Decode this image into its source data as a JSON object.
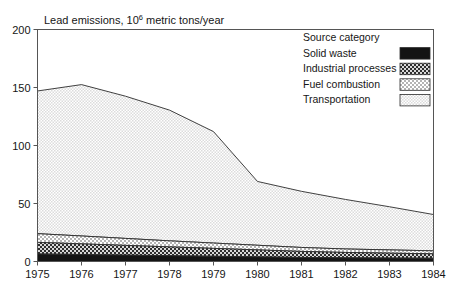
{
  "chart_data": {
    "type": "area",
    "stacked": true,
    "title_main": "Lead emissions, 10",
    "title_exponent": "6",
    "title_tail": " metric tons/year",
    "xlabel": "",
    "ylabel": "",
    "x": [
      1975,
      1976,
      1977,
      1978,
      1979,
      1980,
      1981,
      1982,
      1983,
      1984
    ],
    "categories": [
      "1975",
      "1976",
      "1977",
      "1978",
      "1979",
      "1980",
      "1981",
      "1982",
      "1983",
      "1984"
    ],
    "xlim": [
      1975,
      1984
    ],
    "ylim": [
      0,
      200
    ],
    "yticks": [
      0,
      50,
      100,
      150,
      200
    ],
    "ytick_labels": [
      "0",
      "50",
      "100",
      "150",
      "200"
    ],
    "xticks": [
      1975,
      1976,
      1977,
      1978,
      1979,
      1980,
      1981,
      1982,
      1983,
      1984
    ],
    "grid": false,
    "legend_title": "Source category",
    "legend_position": "top-right",
    "stack_order_bottom_to_top": [
      "Solid waste",
      "Industrial processes",
      "Fuel combustion",
      "Transportation"
    ],
    "series": [
      {
        "name": "Solid waste",
        "fill": "#1c1c1c",
        "pattern": "solid-black",
        "values": [
          6.5,
          6.0,
          5.5,
          5.0,
          4.5,
          4.0,
          3.5,
          3.2,
          3.0,
          2.8
        ]
      },
      {
        "name": "Industrial processes",
        "fill": "#4a4a4a",
        "pattern": "dark-checker",
        "values": [
          10.0,
          9.2,
          8.4,
          7.6,
          6.8,
          6.0,
          5.2,
          4.6,
          4.2,
          3.8
        ]
      },
      {
        "name": "Fuel combustion",
        "fill": "#c9c9c9",
        "pattern": "light-checker",
        "values": [
          7.5,
          6.8,
          6.0,
          5.2,
          4.6,
          4.0,
          3.4,
          3.0,
          2.8,
          2.6
        ]
      },
      {
        "name": "Transportation",
        "fill": "#ececec",
        "pattern": "fine-dot",
        "values": [
          123.0,
          130.5,
          122.6,
          112.7,
          96.1,
          55.0,
          48.4,
          42.7,
          37.2,
          31.3
        ]
      }
    ],
    "totals": [
      147,
      152.5,
      142.5,
      130.5,
      112,
      69,
      60.5,
      53.5,
      47.2,
      40.5
    ],
    "annotations": []
  },
  "legend": {
    "title": "Source category",
    "items": [
      {
        "label": "Solid waste",
        "swatch": "solid-black"
      },
      {
        "label": "Industrial processes",
        "swatch": "dark-checker"
      },
      {
        "label": "Fuel combustion",
        "swatch": "light-checker"
      },
      {
        "label": "Transportation",
        "swatch": "fine-dot"
      }
    ]
  }
}
